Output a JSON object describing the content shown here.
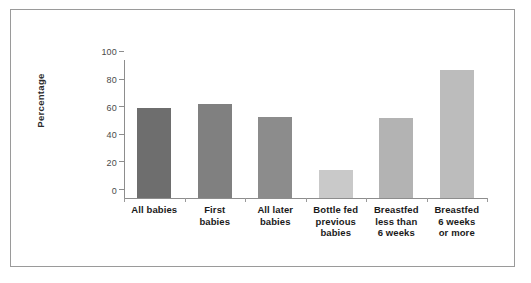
{
  "chart_data": {
    "type": "bar",
    "title": "",
    "xlabel": "",
    "ylabel": "Percentage",
    "ylim": [
      0,
      100
    ],
    "yticks": [
      0,
      20,
      40,
      60,
      80,
      100
    ],
    "ytick_labels": [
      "0",
      "20",
      "40",
      "60",
      "80",
      "100"
    ],
    "grid": false,
    "legend": null,
    "categories": [
      "All babies",
      "First babies",
      "All later babies",
      "Bottle fed previous babies",
      "Breastfed less than 6 weeks",
      "Breastfed 6 weeks or more"
    ],
    "category_lines": [
      [
        "All babies"
      ],
      [
        "First",
        "babies"
      ],
      [
        "All later",
        "babies"
      ],
      [
        "Bottle fed",
        "previous",
        "babies"
      ],
      [
        "Breastfed",
        "less than",
        "6 weeks"
      ],
      [
        "Breastfed",
        "6 weeks",
        "or more"
      ]
    ],
    "values": [
      65,
      68,
      59,
      20,
      58,
      93
    ],
    "bar_colors": [
      "#6e6e6e",
      "#808080",
      "#8c8c8c",
      "#c9c9c9",
      "#b3b3b3",
      "#bcbcbc"
    ]
  },
  "axis": {
    "y_label": "Percentage",
    "y_tick_0": "0",
    "y_tick_1": "20",
    "y_tick_2": "40",
    "y_tick_3": "60",
    "y_tick_4": "80",
    "y_tick_5": "100"
  },
  "labels": {
    "bar1_line1": "All babies",
    "bar2_line1": "First",
    "bar2_line2": "babies",
    "bar3_line1": "All later",
    "bar3_line2": "babies",
    "bar4_line1": "Bottle fed",
    "bar4_line2": "previous",
    "bar4_line3": "babies",
    "bar5_line1": "Breastfed",
    "bar5_line2": "less than",
    "bar5_line3": "6 weeks",
    "bar6_line1": "Breastfed",
    "bar6_line2": "6 weeks",
    "bar6_line3": "or more"
  },
  "colors": {
    "frame_border": "#9a9a9a",
    "axis_line": "#8d8d8d",
    "tick_text": "#4a4a4a",
    "label_text": "#1a1a1a",
    "background": "#ffffff"
  }
}
